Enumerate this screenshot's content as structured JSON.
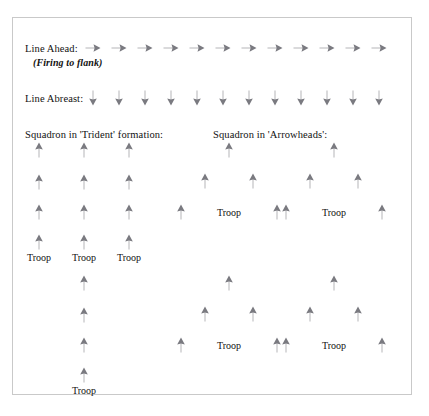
{
  "figure": {
    "arrow_color": "#7a7a80",
    "frame_color": "#c9c9c9",
    "background": "#ffffff",
    "text_color": "#111111"
  },
  "labels": {
    "line_ahead": "Line Ahead:",
    "firing_to_flank": "(Firing to flank)",
    "line_abreast": "Line Abreast:",
    "trident": "Squadron in 'Trident' formation:",
    "arrowheads": "Squadron in 'Arrowheads':",
    "troop": "Troop"
  },
  "rows": {
    "line_ahead": {
      "label": "Line Ahead:",
      "sub_label": "(Firing to flank)",
      "direction": "right",
      "count": 12,
      "y": 30,
      "x_start": 80,
      "x_step": 26
    },
    "line_abreast": {
      "label": "Line Abreast:",
      "direction": "down",
      "count": 12,
      "y": 80,
      "x_start": 80,
      "x_step": 26
    }
  },
  "formations": {
    "trident": {
      "title": "Squadron in 'Trident' formation:",
      "direction": "up",
      "columns": 3,
      "rows_per_column": 4,
      "troop_labels": [
        "Troop",
        "Troop",
        "Troop"
      ],
      "tail_troop_label": "Troop",
      "tail_rows": 4
    },
    "arrowheads": {
      "title": "Squadron in 'Arrowheads':",
      "direction": "up",
      "units": 4,
      "arrows_per_unit": 5,
      "troop_labels": [
        "Troop",
        "Troop",
        "Troop",
        "Troop"
      ]
    }
  },
  "arrow_markers": {
    "line_ahead": [
      {
        "x": 80,
        "y": 30
      },
      {
        "x": 106,
        "y": 30
      },
      {
        "x": 132,
        "y": 30
      },
      {
        "x": 158,
        "y": 30
      },
      {
        "x": 184,
        "y": 30
      },
      {
        "x": 210,
        "y": 30
      },
      {
        "x": 236,
        "y": 30
      },
      {
        "x": 262,
        "y": 30
      },
      {
        "x": 288,
        "y": 30
      },
      {
        "x": 314,
        "y": 30
      },
      {
        "x": 340,
        "y": 30
      },
      {
        "x": 366,
        "y": 30
      }
    ],
    "line_abreast": [
      {
        "x": 80,
        "y": 80
      },
      {
        "x": 106,
        "y": 80
      },
      {
        "x": 132,
        "y": 80
      },
      {
        "x": 158,
        "y": 80
      },
      {
        "x": 184,
        "y": 80
      },
      {
        "x": 210,
        "y": 80
      },
      {
        "x": 236,
        "y": 80
      },
      {
        "x": 262,
        "y": 80
      },
      {
        "x": 288,
        "y": 80
      },
      {
        "x": 314,
        "y": 80
      },
      {
        "x": 340,
        "y": 80
      },
      {
        "x": 366,
        "y": 80
      }
    ],
    "trident_top": [
      {
        "x": 26,
        "y": 132
      },
      {
        "x": 26,
        "y": 164
      },
      {
        "x": 26,
        "y": 194
      },
      {
        "x": 26,
        "y": 224
      },
      {
        "x": 71,
        "y": 132
      },
      {
        "x": 71,
        "y": 164
      },
      {
        "x": 71,
        "y": 194
      },
      {
        "x": 71,
        "y": 224
      },
      {
        "x": 116,
        "y": 132
      },
      {
        "x": 116,
        "y": 164
      },
      {
        "x": 116,
        "y": 194
      },
      {
        "x": 116,
        "y": 224
      }
    ],
    "trident_tail": [
      {
        "x": 71,
        "y": 265
      },
      {
        "x": 71,
        "y": 297
      },
      {
        "x": 71,
        "y": 327
      },
      {
        "x": 71,
        "y": 357
      }
    ],
    "arrowhead_1": [
      {
        "x": 216,
        "y": 132
      },
      {
        "x": 192,
        "y": 163
      },
      {
        "x": 240,
        "y": 163
      },
      {
        "x": 168,
        "y": 194
      },
      {
        "x": 264,
        "y": 194
      }
    ],
    "arrowhead_2": [
      {
        "x": 321,
        "y": 132
      },
      {
        "x": 297,
        "y": 163
      },
      {
        "x": 345,
        "y": 163
      },
      {
        "x": 273,
        "y": 194
      },
      {
        "x": 369,
        "y": 194
      }
    ],
    "arrowhead_3": [
      {
        "x": 216,
        "y": 265
      },
      {
        "x": 192,
        "y": 296
      },
      {
        "x": 240,
        "y": 296
      },
      {
        "x": 168,
        "y": 327
      },
      {
        "x": 264,
        "y": 327
      }
    ],
    "arrowhead_4": [
      {
        "x": 321,
        "y": 265
      },
      {
        "x": 297,
        "y": 296
      },
      {
        "x": 345,
        "y": 296
      },
      {
        "x": 273,
        "y": 327
      },
      {
        "x": 369,
        "y": 327
      }
    ]
  },
  "troop_markers": {
    "trident_top": [
      {
        "x": 26,
        "y": 235,
        "text": "Troop"
      },
      {
        "x": 71,
        "y": 235,
        "text": "Troop"
      },
      {
        "x": 116,
        "y": 235,
        "text": "Troop"
      }
    ],
    "trident_tail": [
      {
        "x": 71,
        "y": 368,
        "text": "Troop"
      }
    ],
    "arrowheads": [
      {
        "x": 216,
        "y": 190,
        "text": "Troop"
      },
      {
        "x": 321,
        "y": 190,
        "text": "Troop"
      },
      {
        "x": 216,
        "y": 323,
        "text": "Troop"
      },
      {
        "x": 321,
        "y": 323,
        "text": "Troop"
      }
    ]
  }
}
